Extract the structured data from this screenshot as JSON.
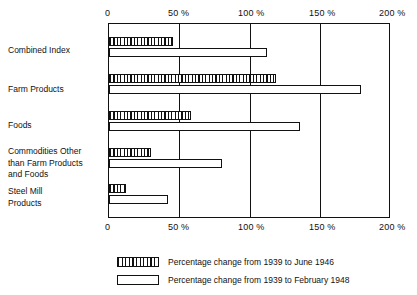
{
  "chart_data": {
    "type": "bar",
    "orientation": "horizontal",
    "title": "",
    "xlabel": "",
    "ylabel": "",
    "xlim": [
      0,
      200
    ],
    "xticks": [
      0,
      50,
      100,
      150,
      200
    ],
    "xtick_labels": [
      "0",
      "50 %",
      "100 %",
      "150 %",
      "200 %"
    ],
    "grid": true,
    "grid_axis": "x",
    "legend_position": "below",
    "categories": [
      "Combined Index",
      "Farm Products",
      "Foods",
      "Commodities Other\nthan Farm Products\nand Foods",
      "Steel Mill\nProducts"
    ],
    "series": [
      {
        "name": "Percentage change from 1939 to June 1946",
        "style": "hatched",
        "values": [
          46,
          120,
          59,
          30,
          12
        ]
      },
      {
        "name": "Percentage change from 1939 to February 1948",
        "style": "open",
        "values": [
          113,
          181,
          137,
          81,
          42
        ]
      }
    ]
  },
  "axis": {
    "top_ticks": [
      {
        "label": "0",
        "value": 0
      },
      {
        "label": "50 %",
        "value": 50
      },
      {
        "label": "100 %",
        "value": 100
      },
      {
        "label": "150 %",
        "value": 150
      },
      {
        "label": "200 %",
        "value": 200
      }
    ],
    "bottom_ticks": [
      {
        "label": "0",
        "value": 0
      },
      {
        "label": "50 %",
        "value": 50
      },
      {
        "label": "100 %",
        "value": 100
      },
      {
        "label": "150 %",
        "value": 150
      },
      {
        "label": "200 %",
        "value": 200
      }
    ]
  },
  "categories": [
    {
      "label": "Combined Index"
    },
    {
      "label": "Farm Products"
    },
    {
      "label": "Foods"
    },
    {
      "label": "Commodities Other\nthan Farm Products\nand Foods"
    },
    {
      "label": "Steel Mill\nProducts"
    }
  ],
  "legend": {
    "items": [
      {
        "style": "hatched",
        "label": "Percentage change from 1939 to June 1946"
      },
      {
        "style": "open",
        "label": "Percentage change from 1939 to February 1948"
      }
    ]
  },
  "colors": {
    "ink": "#111111",
    "paper": "#ffffff"
  }
}
